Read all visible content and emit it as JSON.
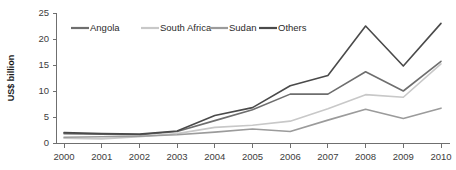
{
  "chart_data": {
    "type": "line",
    "title": "",
    "subtitle": "",
    "xlabel": "",
    "ylabel": "US$ billion",
    "xlim": [
      2000,
      2010
    ],
    "ylim": [
      0,
      25
    ],
    "yticks": [
      0,
      5,
      10,
      15,
      20,
      25
    ],
    "grid": false,
    "legend_position": "top-inside",
    "categories": [
      "2000",
      "2001",
      "2002",
      "2003",
      "2004",
      "2005",
      "2006",
      "2007",
      "2008",
      "2009",
      "2010"
    ],
    "x": [
      2000,
      2001,
      2002,
      2003,
      2004,
      2005,
      2006,
      2007,
      2008,
      2009,
      2010
    ],
    "series": [
      {
        "name": "Angola",
        "color": "#6e6e6e",
        "values": [
          1.8,
          1.7,
          1.6,
          2.2,
          4.3,
          6.4,
          9.4,
          9.4,
          13.7,
          10.0,
          15.7
        ]
      },
      {
        "name": "South Africa",
        "color": "#c8c8c8",
        "values": [
          0.9,
          0.8,
          1.2,
          1.8,
          3.0,
          3.4,
          4.2,
          6.6,
          9.3,
          8.8,
          15.2
        ]
      },
      {
        "name": "Sudan",
        "color": "#9b9b9b",
        "values": [
          1.1,
          1.2,
          1.3,
          1.6,
          2.1,
          2.7,
          2.2,
          4.4,
          6.5,
          4.7,
          6.7
        ]
      },
      {
        "name": "Others",
        "color": "#4a4a4a",
        "values": [
          2.0,
          1.8,
          1.7,
          2.3,
          5.3,
          6.8,
          11.0,
          13.0,
          22.5,
          14.8,
          23.0
        ]
      }
    ]
  },
  "legend": {
    "items": [
      {
        "label": "Angola",
        "color": "#6e6e6e"
      },
      {
        "label": "South Africa",
        "color": "#c8c8c8"
      },
      {
        "label": "Sudan",
        "color": "#9b9b9b"
      },
      {
        "label": "Others",
        "color": "#4a4a4a"
      }
    ]
  },
  "axes": {
    "y_label": "US$ billion",
    "y_ticks": [
      "0",
      "5",
      "10",
      "15",
      "20",
      "25"
    ],
    "x_ticks": [
      "2000",
      "2001",
      "2002",
      "2003",
      "2004",
      "2005",
      "2006",
      "2007",
      "2008",
      "2009",
      "2010"
    ]
  }
}
